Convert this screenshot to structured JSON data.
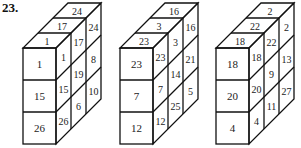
{
  "problem_number": "23.",
  "figures": [
    {
      "front": [
        "1",
        "15",
        "26"
      ],
      "side": [
        "1",
        "15",
        "26",
        "17",
        "19",
        "6",
        "24",
        "8",
        "10"
      ],
      "top": [
        "1",
        "17",
        "24"
      ]
    },
    {
      "front": [
        "23",
        "7",
        "12"
      ],
      "side": [
        "23",
        "7",
        "12",
        "3",
        "14",
        "25",
        "16",
        "21",
        "5"
      ],
      "top": [
        "23",
        "3",
        "16"
      ]
    },
    {
      "front": [
        "18",
        "20",
        "4"
      ],
      "side": [
        "18",
        "20",
        "4",
        "22",
        "9",
        "11",
        "2",
        "13",
        "27"
      ],
      "top": [
        "18",
        "22",
        "2"
      ]
    }
  ]
}
